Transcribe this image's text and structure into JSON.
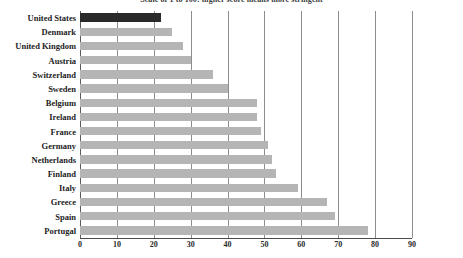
{
  "chart_data": {
    "type": "bar",
    "orientation": "horizontal",
    "title": "Scale of 1 to 100: higher score means more stringent",
    "xlabel": "",
    "ylabel": "",
    "xlim": [
      0,
      90
    ],
    "xticks": [
      0,
      10,
      20,
      30,
      40,
      50,
      60,
      70,
      80,
      90
    ],
    "grid": true,
    "legend": false,
    "categories": [
      "United States",
      "Denmark",
      "United Kingdom",
      "Austria",
      "Switzerland",
      "Sweden",
      "Belgium",
      "Ireland",
      "France",
      "Germany",
      "Netherlands",
      "Finland",
      "Italy",
      "Greece",
      "Spain",
      "Portugal"
    ],
    "values": [
      22,
      25,
      28,
      30,
      36,
      40,
      48,
      48,
      49,
      51,
      52,
      53,
      59,
      67,
      69,
      78
    ],
    "highlight_category": "United States",
    "colors": {
      "bar": "#b5b5b5",
      "highlight_bar": "#2a2a2a",
      "gridline": "#8d8d8d",
      "axis": "#4a4a4a",
      "label_text": "#1d1d1d",
      "title_text": "#3a3a3a"
    }
  }
}
